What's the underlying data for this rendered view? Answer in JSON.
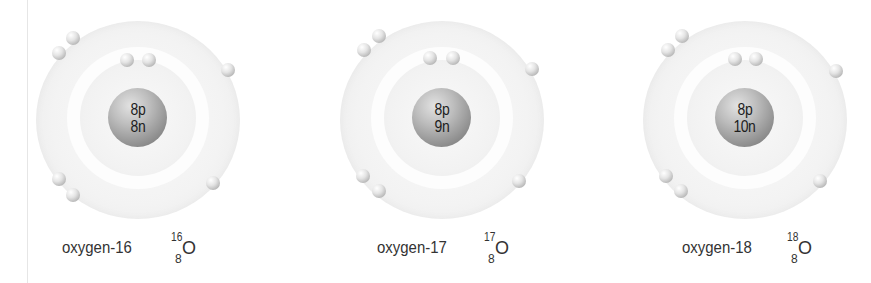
{
  "diagram": {
    "atoms": [
      {
        "name": "oxygen-16",
        "protons_label": "8p",
        "neutrons_label": "8n",
        "mass_number": "16",
        "atomic_number": "8",
        "symbol": "O",
        "electrons_inner_shell": 2,
        "electrons_outer_shell": 6
      },
      {
        "name": "oxygen-17",
        "protons_label": "8p",
        "neutrons_label": "9n",
        "mass_number": "17",
        "atomic_number": "8",
        "symbol": "O",
        "electrons_inner_shell": 2,
        "electrons_outer_shell": 6
      },
      {
        "name": "oxygen-18",
        "protons_label": "8p",
        "neutrons_label": "10n",
        "mass_number": "18",
        "atomic_number": "8",
        "symbol": "O",
        "electrons_inner_shell": 2,
        "electrons_outer_shell": 6
      }
    ],
    "colors": {
      "background": "#ffffff",
      "shell": "#f0f0f0",
      "nucleus_dark": "#6e6e6e",
      "nucleus_light": "#e2e2e2",
      "electron": "#c4c4c4",
      "text": "#333333"
    }
  }
}
